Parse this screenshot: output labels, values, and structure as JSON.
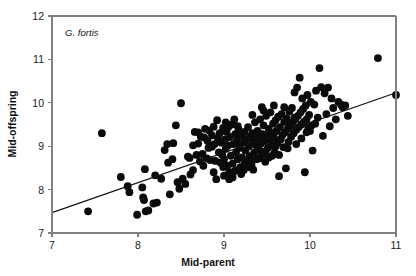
{
  "chart_data": {
    "type": "scatter",
    "title": "",
    "annotation": "G. fortis",
    "xlabel": "Mid-parent",
    "ylabel": "Mid-offspring",
    "xlim": [
      7,
      11
    ],
    "ylim": [
      7,
      12
    ],
    "xticks": [
      7,
      8,
      9,
      10,
      11
    ],
    "yticks": [
      7,
      8,
      9,
      10,
      11,
      12
    ],
    "xtick_labels": [
      "7",
      "8",
      "9",
      "10",
      "11"
    ],
    "ytick_labels": [
      "7",
      "8",
      "9",
      "10",
      "11",
      "12"
    ],
    "grid": false,
    "legend": "none",
    "marker": "filled-circle",
    "marker_color": "#0b0b0b",
    "marker_size_px": 4.6,
    "axis_color": "#808080",
    "regression_line": {
      "label": "regression-line",
      "color": "#111111",
      "x_start": 7.0,
      "y_start": 7.47,
      "x_end": 11.0,
      "y_end": 10.23,
      "slope": 0.69,
      "intercept": 2.64
    },
    "points": [
      [
        7.42,
        7.5
      ],
      [
        7.58,
        9.3
      ],
      [
        7.8,
        8.29
      ],
      [
        7.88,
        8.08
      ],
      [
        7.9,
        7.94
      ],
      [
        7.99,
        7.42
      ],
      [
        8.05,
        8.05
      ],
      [
        8.06,
        7.82
      ],
      [
        8.07,
        7.76
      ],
      [
        8.08,
        8.47
      ],
      [
        8.09,
        7.5
      ],
      [
        8.12,
        7.52
      ],
      [
        8.18,
        7.68
      ],
      [
        8.2,
        8.33
      ],
      [
        8.22,
        7.7
      ],
      [
        8.27,
        8.25
      ],
      [
        8.31,
        8.91
      ],
      [
        8.34,
        9.05
      ],
      [
        8.35,
        8.62
      ],
      [
        8.37,
        7.89
      ],
      [
        8.4,
        8.7
      ],
      [
        8.41,
        9.07
      ],
      [
        8.44,
        9.48
      ],
      [
        8.46,
        8.17
      ],
      [
        8.48,
        8.02
      ],
      [
        8.5,
        9.99
      ],
      [
        8.52,
        8.25
      ],
      [
        8.55,
        8.13
      ],
      [
        8.58,
        8.76
      ],
      [
        8.6,
        8.73
      ],
      [
        8.61,
        8.35
      ],
      [
        8.64,
        9.02
      ],
      [
        8.66,
        9.33
      ],
      [
        8.68,
        8.8
      ],
      [
        8.7,
        9.06
      ],
      [
        8.72,
        8.65
      ],
      [
        8.73,
        9.22
      ],
      [
        8.75,
        8.82
      ],
      [
        8.77,
        9.2
      ],
      [
        8.78,
        9.4
      ],
      [
        8.8,
        8.72
      ],
      [
        8.81,
        9.12
      ],
      [
        8.83,
        9.36
      ],
      [
        8.84,
        8.68
      ],
      [
        8.86,
        8.99
      ],
      [
        8.88,
        9.45
      ],
      [
        8.89,
        9.05
      ],
      [
        8.9,
        8.66
      ],
      [
        8.91,
        8.24
      ],
      [
        8.93,
        9.18
      ],
      [
        8.94,
        8.86
      ],
      [
        8.95,
        9.3
      ],
      [
        8.96,
        8.62
      ],
      [
        8.97,
        9.08
      ],
      [
        8.98,
        8.8
      ],
      [
        8.99,
        9.42
      ],
      [
        9.0,
        8.7
      ],
      [
        9.01,
        9.15
      ],
      [
        9.02,
        8.94
      ],
      [
        9.03,
        9.33
      ],
      [
        9.04,
        8.55
      ],
      [
        9.05,
        9.02
      ],
      [
        9.06,
        8.24
      ],
      [
        9.07,
        9.21
      ],
      [
        9.08,
        8.78
      ],
      [
        9.09,
        9.5
      ],
      [
        9.1,
        8.6
      ],
      [
        9.11,
        9.05
      ],
      [
        9.12,
        8.42
      ],
      [
        9.13,
        9.28
      ],
      [
        9.14,
        8.86
      ],
      [
        9.15,
        9.12
      ],
      [
        9.16,
        8.7
      ],
      [
        9.17,
        9.38
      ],
      [
        9.18,
        8.96
      ],
      [
        9.19,
        8.52
      ],
      [
        9.2,
        9.25
      ],
      [
        9.21,
        8.74
      ],
      [
        9.22,
        9.08
      ],
      [
        9.23,
        8.45
      ],
      [
        9.24,
        9.33
      ],
      [
        9.25,
        8.9
      ],
      [
        9.26,
        9.16
      ],
      [
        9.27,
        8.64
      ],
      [
        9.28,
        9.44
      ],
      [
        9.29,
        9.0
      ],
      [
        9.3,
        8.77
      ],
      [
        9.31,
        9.22
      ],
      [
        9.32,
        8.58
      ],
      [
        9.33,
        9.3
      ],
      [
        9.34,
        9.1
      ],
      [
        9.35,
        8.85
      ],
      [
        9.36,
        9.55
      ],
      [
        9.37,
        9.02
      ],
      [
        9.38,
        8.7
      ],
      [
        9.39,
        9.35
      ],
      [
        9.4,
        9.18
      ],
      [
        9.41,
        8.92
      ],
      [
        9.42,
        9.62
      ],
      [
        9.43,
        9.06
      ],
      [
        9.44,
        8.8
      ],
      [
        9.45,
        9.28
      ],
      [
        9.46,
        9.48
      ],
      [
        9.47,
        9.12
      ],
      [
        9.48,
        8.88
      ],
      [
        9.49,
        9.7
      ],
      [
        9.5,
        9.24
      ],
      [
        9.51,
        8.96
      ],
      [
        9.52,
        9.4
      ],
      [
        9.53,
        9.14
      ],
      [
        9.54,
        9.78
      ],
      [
        9.55,
        9.3
      ],
      [
        9.56,
        9.02
      ],
      [
        9.57,
        9.52
      ],
      [
        9.58,
        9.2
      ],
      [
        9.59,
        8.86
      ],
      [
        9.6,
        9.6
      ],
      [
        9.61,
        9.35
      ],
      [
        9.62,
        9.08
      ],
      [
        9.63,
        9.68
      ],
      [
        9.64,
        8.31
      ],
      [
        9.65,
        9.44
      ],
      [
        9.66,
        9.16
      ],
      [
        9.67,
        9.74
      ],
      [
        9.68,
        9.26
      ],
      [
        9.69,
        8.98
      ],
      [
        9.7,
        9.56
      ],
      [
        9.71,
        9.32
      ],
      [
        9.72,
        8.49
      ],
      [
        9.73,
        9.64
      ],
      [
        9.74,
        9.4
      ],
      [
        9.75,
        9.1
      ],
      [
        9.76,
        9.8
      ],
      [
        9.77,
        9.48
      ],
      [
        9.78,
        9.22
      ],
      [
        9.79,
        9.88
      ],
      [
        9.8,
        9.55
      ],
      [
        9.81,
        9.3
      ],
      [
        9.82,
        10.24
      ],
      [
        9.83,
        9.62
      ],
      [
        9.84,
        9.38
      ],
      [
        9.85,
        10.35
      ],
      [
        9.86,
        9.7
      ],
      [
        9.87,
        9.44
      ],
      [
        9.88,
        10.58
      ],
      [
        9.89,
        9.78
      ],
      [
        9.9,
        9.5
      ],
      [
        9.91,
        10.1
      ],
      [
        9.92,
        9.86
      ],
      [
        9.93,
        9.56
      ],
      [
        9.94,
        8.4
      ],
      [
        9.95,
        9.94
      ],
      [
        9.96,
        9.62
      ],
      [
        9.97,
        10.18
      ],
      [
        9.98,
        9.42
      ],
      [
        9.99,
        9.72
      ],
      [
        10.0,
        9.35
      ],
      [
        10.01,
        10.02
      ],
      [
        10.02,
        9.48
      ],
      [
        10.03,
        8.9
      ],
      [
        10.05,
        9.96
      ],
      [
        10.07,
        10.28
      ],
      [
        10.09,
        9.66
      ],
      [
        10.11,
        10.8
      ],
      [
        10.13,
        10.36
      ],
      [
        10.15,
        9.24
      ],
      [
        10.17,
        10.22
      ],
      [
        10.19,
        9.74
      ],
      [
        10.21,
        10.35
      ],
      [
        10.23,
        9.46
      ],
      [
        10.25,
        10.1
      ],
      [
        10.27,
        9.88
      ],
      [
        10.3,
        9.62
      ],
      [
        10.33,
        10.02
      ],
      [
        10.36,
        9.96
      ],
      [
        10.38,
        9.9
      ],
      [
        10.41,
        9.94
      ],
      [
        10.44,
        9.7
      ],
      [
        10.79,
        11.03
      ],
      [
        11.0,
        10.18
      ],
      [
        8.92,
        9.6
      ],
      [
        9.05,
        9.44
      ],
      [
        9.18,
        9.02
      ],
      [
        9.3,
        8.66
      ],
      [
        9.44,
        9.9
      ],
      [
        9.52,
        8.74
      ],
      [
        9.6,
        9.0
      ],
      [
        9.12,
        9.62
      ],
      [
        9.24,
        8.6
      ],
      [
        9.36,
        9.26
      ],
      [
        8.86,
        9.25
      ],
      [
        8.99,
        8.52
      ],
      [
        9.06,
        8.4
      ],
      [
        9.14,
        8.45
      ],
      [
        9.2,
        8.36
      ],
      [
        9.28,
        8.52
      ],
      [
        9.34,
        8.46
      ],
      [
        9.41,
        8.72
      ],
      [
        9.48,
        8.64
      ],
      [
        9.56,
        8.78
      ],
      [
        8.7,
        9.32
      ],
      [
        8.82,
        8.96
      ],
      [
        9.02,
        9.55
      ],
      [
        9.16,
        9.46
      ],
      [
        9.33,
        9.72
      ],
      [
        9.46,
        9.82
      ],
      [
        9.58,
        9.94
      ],
      [
        9.7,
        9.9
      ],
      [
        9.82,
        9.66
      ],
      [
        9.9,
        9.18
      ],
      [
        8.64,
        8.45
      ],
      [
        8.76,
        8.55
      ],
      [
        8.88,
        8.4
      ],
      [
        9.0,
        8.32
      ],
      [
        9.1,
        8.28
      ],
      [
        9.64,
        8.8
      ],
      [
        9.74,
        8.95
      ],
      [
        9.84,
        9.05
      ],
      [
        9.96,
        9.32
      ],
      [
        10.06,
        9.52
      ]
    ],
    "n_points": 215
  },
  "axis_meta": {
    "x_axis_name": "x-axis",
    "y_axis_name": "y-axis"
  }
}
